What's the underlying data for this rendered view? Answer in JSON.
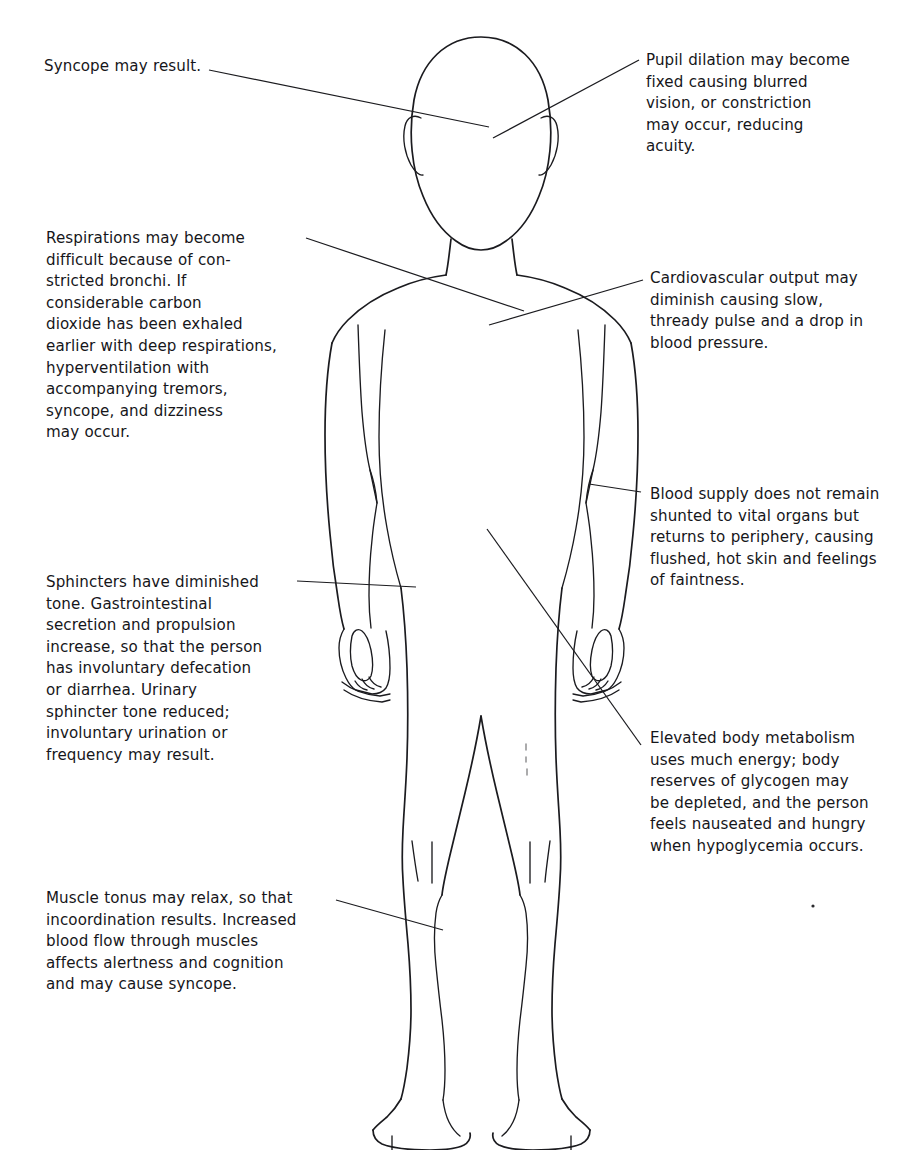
{
  "document": {
    "title": "Physiologic responses of the body",
    "figure_name": "human-body-front-outline"
  },
  "annotations": [
    {
      "id": "syncope",
      "name": "annotation-syncope",
      "side": "left",
      "target": "head",
      "text": "Syncope may result."
    },
    {
      "id": "pupil",
      "name": "annotation-pupil-dilation",
      "side": "right",
      "target": "eye",
      "text": "Pupil dilation may become\nfixed causing blurred\nvision, or constriction\nmay occur, reducing\nacuity."
    },
    {
      "id": "respirations",
      "name": "annotation-respirations",
      "side": "left",
      "target": "chest",
      "text": "Respirations may become\ndifficult because of con-\nstricted bronchi.  If\nconsiderable carbon\ndioxide has been exhaled\nearlier with deep respirations,\nhyperventilation with\naccompanying tremors,\nsyncope, and dizziness\nmay occur."
    },
    {
      "id": "cardiovascular",
      "name": "annotation-cardiovascular-output",
      "side": "right",
      "target": "chest",
      "text": "Cardiovascular output may\ndiminish causing slow,\nthready pulse and a drop in\nblood pressure."
    },
    {
      "id": "blood_supply",
      "name": "annotation-blood-supply",
      "side": "right",
      "target": "forearm",
      "text": "Blood supply does not remain\nshunted to vital organs but\nreturns to periphery, causing\nflushed, hot skin and feelings\nof faintness."
    },
    {
      "id": "sphincters",
      "name": "annotation-sphincters",
      "side": "left",
      "target": "abdomen",
      "text": "Sphincters have diminished\ntone.  Gastrointestinal\nsecretion and propulsion\nincrease, so that the person\nhas involuntary defecation\nor diarrhea.  Urinary\nsphincter tone reduced;\ninvoluntary urination or\nfrequency may result."
    },
    {
      "id": "metabolism",
      "name": "annotation-body-metabolism",
      "side": "right",
      "target": "hip",
      "text": "Elevated body metabolism\nuses much energy; body\nreserves of glycogen may\nbe depleted, and the person\nfeels nauseated and hungry\nwhen hypoglycemia occurs."
    },
    {
      "id": "muscle",
      "name": "annotation-muscle-tonus",
      "side": "left",
      "target": "thigh",
      "text": "Muscle tonus may relax, so that\nincoordination results.  Increased\nblood flow through muscles\naffects alertness and cognition\nand may cause syncope."
    }
  ],
  "colors": {
    "ink": "#1b1b1f",
    "text": "#16161a",
    "background": "#ffffff"
  }
}
